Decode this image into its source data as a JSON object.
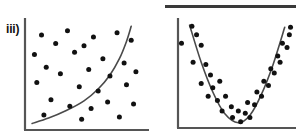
{
  "figure": {
    "title": "",
    "background_color": "#ffffff",
    "ink_color": "#111111",
    "axis_color": "#555555",
    "curve_color": "#4a4a4a",
    "top_rule_color": "#3a3a3a"
  },
  "panels": [
    {
      "id": "iii",
      "label": "iii)",
      "description": "scattered points with no relationship and an exponential trend curve"
    },
    {
      "id": "iv",
      "label": "iv)",
      "description": "U-shaped (quadratic) relationship with fitted parabola"
    }
  ],
  "chart_data": [
    {
      "type": "scatter",
      "id": "iii",
      "title": "iii)",
      "xlabel": "",
      "ylabel": "",
      "xlim": [
        0,
        100
      ],
      "ylim": [
        0,
        100
      ],
      "grid": false,
      "legend": "none",
      "annotation": "random scatter with exponential curve overlay",
      "points": [
        {
          "x": 14,
          "y": 88
        },
        {
          "x": 36,
          "y": 92
        },
        {
          "x": 58,
          "y": 86
        },
        {
          "x": 78,
          "y": 90
        },
        {
          "x": 26,
          "y": 80
        },
        {
          "x": 50,
          "y": 78
        },
        {
          "x": 90,
          "y": 83
        },
        {
          "x": 8,
          "y": 70
        },
        {
          "x": 42,
          "y": 72
        },
        {
          "x": 66,
          "y": 66
        },
        {
          "x": 84,
          "y": 62
        },
        {
          "x": 18,
          "y": 58
        },
        {
          "x": 30,
          "y": 52
        },
        {
          "x": 54,
          "y": 56
        },
        {
          "x": 72,
          "y": 50
        },
        {
          "x": 94,
          "y": 54
        },
        {
          "x": 10,
          "y": 44
        },
        {
          "x": 46,
          "y": 40
        },
        {
          "x": 62,
          "y": 36
        },
        {
          "x": 86,
          "y": 42
        },
        {
          "x": 22,
          "y": 28
        },
        {
          "x": 38,
          "y": 22
        },
        {
          "x": 56,
          "y": 20
        },
        {
          "x": 70,
          "y": 26
        },
        {
          "x": 92,
          "y": 24
        },
        {
          "x": 16,
          "y": 14
        },
        {
          "x": 48,
          "y": 10
        },
        {
          "x": 80,
          "y": 12
        }
      ],
      "curve": {
        "name": "exponential trend",
        "form": "y = exp(k*x)",
        "x": [
          6,
          20,
          35,
          50,
          62,
          72,
          80,
          86,
          90
        ],
        "y": [
          6,
          11,
          18,
          27,
          38,
          51,
          66,
          82,
          96
        ]
      }
    },
    {
      "type": "scatter",
      "id": "iv",
      "title": "iv)",
      "xlabel": "",
      "ylabel": "",
      "xlim": [
        0,
        100
      ],
      "ylim": [
        0,
        100
      ],
      "grid": false,
      "legend": "none",
      "annotation": "quadratic (U-shaped) relationship with fitted parabola",
      "points": [
        {
          "x": 3,
          "y": 80
        },
        {
          "x": 12,
          "y": 96
        },
        {
          "x": 16,
          "y": 88
        },
        {
          "x": 20,
          "y": 78
        },
        {
          "x": 13,
          "y": 62
        },
        {
          "x": 24,
          "y": 60
        },
        {
          "x": 28,
          "y": 50
        },
        {
          "x": 20,
          "y": 42
        },
        {
          "x": 30,
          "y": 38
        },
        {
          "x": 36,
          "y": 44
        },
        {
          "x": 26,
          "y": 30
        },
        {
          "x": 34,
          "y": 26
        },
        {
          "x": 41,
          "y": 30
        },
        {
          "x": 38,
          "y": 16
        },
        {
          "x": 46,
          "y": 20
        },
        {
          "x": 47,
          "y": 10
        },
        {
          "x": 52,
          "y": 16
        },
        {
          "x": 54,
          "y": 6
        },
        {
          "x": 58,
          "y": 14
        },
        {
          "x": 62,
          "y": 10
        },
        {
          "x": 60,
          "y": 24
        },
        {
          "x": 66,
          "y": 22
        },
        {
          "x": 68,
          "y": 34
        },
        {
          "x": 72,
          "y": 30
        },
        {
          "x": 74,
          "y": 44
        },
        {
          "x": 78,
          "y": 40
        },
        {
          "x": 80,
          "y": 56
        },
        {
          "x": 83,
          "y": 52
        },
        {
          "x": 86,
          "y": 68
        },
        {
          "x": 88,
          "y": 62
        },
        {
          "x": 90,
          "y": 80
        },
        {
          "x": 94,
          "y": 76
        },
        {
          "x": 96,
          "y": 88
        },
        {
          "x": 97,
          "y": 95
        }
      ],
      "curve": {
        "name": "quadratic fit",
        "form": "y = a(x - h)^2 + k",
        "vertex": {
          "x": 52,
          "y": 5
        },
        "x": [
          10,
          20,
          30,
          40,
          52,
          62,
          72,
          82,
          92
        ],
        "y": [
          97,
          62,
          34,
          14,
          5,
          12,
          32,
          60,
          95
        ]
      }
    }
  ]
}
